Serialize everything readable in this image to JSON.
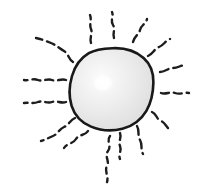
{
  "artwork": {
    "title": "Sun",
    "subject": "hand-drawn sun with radiating squiggly rays",
    "style": "sketch",
    "canvas": {
      "width": 207,
      "height": 195,
      "background_color": "#ffffff"
    },
    "disc": {
      "name": "sun-disc",
      "center_x": 112,
      "center_y": 89,
      "radius_x": 41,
      "radius_y": 41,
      "fill_color": "#ebebeb",
      "fill_color_edge": "#dedede",
      "outline_color": "#191919",
      "outline_width": 2.6,
      "outline_path": "M112.5,48.2 C125.5,47.6 136.0,51.2 143.6,58.0 C150.8,64.4 153.6,72.8 153.4,82.4 C153.2,92.6 151.6,102.0 146.4,110.8 C141.0,119.8 132.6,126.2 122.4,128.8 C112.0,131.4 100.6,130.6 91.0,126.6 C81.4,122.6 74.6,115.4 71.6,105.8 C68.6,96.2 69.2,85.6 72.0,76.0 C74.8,66.4 80.4,58.2 88.8,53.2 C96.0,48.9 104.2,48.5 112.5,48.2 Z"
    },
    "highlight": {
      "name": "disc-highlight",
      "center_x": 103,
      "center_y": 83,
      "radius_x": 11,
      "radius_y": 9,
      "color": "#ffffff"
    },
    "rays": [
      {
        "name": "ray-n",
        "direction": "north",
        "angle_deg": 90,
        "dash_pattern": "7 5",
        "stroke_width": 2.4,
        "path": "M114,38 C112,33 116,30 113,25 C110,20 114,17 112,12"
      },
      {
        "name": "ray-nne",
        "direction": "north-northeast",
        "angle_deg": 67,
        "dash_pattern": "8 5",
        "stroke_width": 2.4,
        "path": "M133,42 C134,36 139,35 140,30 C141,25 146,24 147,19"
      },
      {
        "name": "ray-ne",
        "direction": "northeast",
        "angle_deg": 45,
        "dash_pattern": "9 5",
        "stroke_width": 2.4,
        "path": "M148,56 C153,54 154,49 159,47 C164,45 165,41 170,39"
      },
      {
        "name": "ray-ene",
        "direction": "east-northeast",
        "angle_deg": 22,
        "dash_pattern": "9 5",
        "stroke_width": 2.4,
        "path": "M160,72 C165,72 168,68 173,68 C178,68 181,65 186,65"
      },
      {
        "name": "ray-e",
        "direction": "east",
        "angle_deg": 0,
        "dash_pattern": "8 5",
        "stroke_width": 2.4,
        "path": "M161,93 C166,95 170,91 175,93 C180,95 184,92 189,93"
      },
      {
        "name": "ray-ese",
        "direction": "east-southeast",
        "angle_deg": -25,
        "dash_pattern": "9 5",
        "stroke_width": 2.4,
        "path": "M152,112 C157,114 156,119 161,121 C166,123 166,128 171,130"
      },
      {
        "name": "ray-se",
        "direction": "southeast",
        "angle_deg": -45,
        "dash_pattern": "9 5",
        "stroke_width": 2.4,
        "path": "M137,126 C140,131 137,135 140,140 C143,145 140,149 143,154"
      },
      {
        "name": "ray-sse",
        "direction": "south-southeast",
        "angle_deg": -67,
        "dash_pattern": "7 5",
        "stroke_width": 2.4,
        "path": "M120,133 C122,138 118,141 120,146 C122,151 118,154 120,159"
      },
      {
        "name": "ray-s",
        "direction": "south",
        "angle_deg": -90,
        "dash_pattern": "6 5",
        "stroke_width": 2.4,
        "path": "M110,136 C106,141 112,146 108,151 C104,156 110,161 107,166 C104,171 109,176 107,182"
      },
      {
        "name": "ray-ssw",
        "direction": "south-southwest",
        "angle_deg": -113,
        "dash_pattern": "8 5",
        "stroke_width": 2.4,
        "path": "M88,131 C85,136 79,134 76,139 C73,144 67,143 64,148"
      },
      {
        "name": "ray-sw",
        "direction": "southwest",
        "angle_deg": -135,
        "dash_pattern": "8 5",
        "stroke_width": 2.4,
        "path": "M75,118 C70,120 69,125 64,127 C59,129 58,134 53,136 C48,138 45,140 41,141"
      },
      {
        "name": "ray-wsw",
        "direction": "west-southwest",
        "angle_deg": -157,
        "dash_pattern": "8 5",
        "stroke_width": 2.4,
        "path": "M66,102 C61,104 57,100 52,102 C47,104 43,100 38,102 C33,104 29,102 24,103"
      },
      {
        "name": "ray-w",
        "direction": "west",
        "angle_deg": 180,
        "dash_pattern": "8 5",
        "stroke_width": 2.4,
        "path": "M66,80 C61,78 57,82 52,80 C47,78 43,82 38,80 C33,78 29,81 24,80"
      },
      {
        "name": "ray-wnw",
        "direction": "west-northwest",
        "angle_deg": 157,
        "dash_pattern": "8 5",
        "stroke_width": 2.4,
        "path": "M73,62 C68,59 69,54 64,51 C59,48 56,45 51,43 C46,41 41,39 36,38"
      },
      {
        "name": "ray-nnw",
        "direction": "north-northwest",
        "angle_deg": 113,
        "dash_pattern": "7 5",
        "stroke_width": 2.4,
        "path": "M91,43 C89,38 93,34 91,29 C89,24 92,20 90,15"
      }
    ]
  }
}
